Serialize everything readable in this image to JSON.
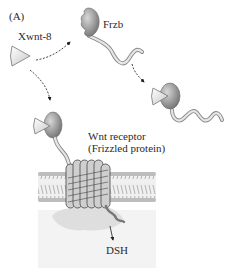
{
  "panel_label": "(A)",
  "labels": {
    "ligand": "Xwnt-8",
    "antagonist": "Frzb",
    "receptor_line1": "Wnt receptor",
    "receptor_line2": "(Frizzled protein)",
    "downstream": "DSH"
  },
  "colors": {
    "ligand_fill": "#e6e6e6",
    "protein_head": "#8c8c8c",
    "tail_fill": "#d9d9d9",
    "membrane_band": "#c8c8c8",
    "cytoplasm": "#f2f2f2",
    "receptor_shadow": "#dcdcdc"
  }
}
